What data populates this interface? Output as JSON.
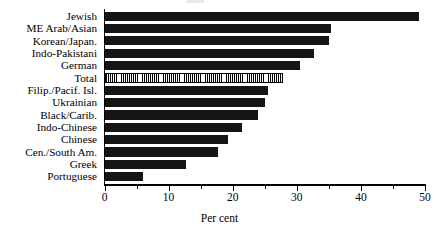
{
  "chart_data": {
    "type": "bar",
    "orientation": "horizontal",
    "title": "",
    "xlabel": "Per cent",
    "ylabel": "",
    "xlim": [
      0,
      50
    ],
    "xticks": [
      0,
      10,
      20,
      30,
      40,
      50
    ],
    "xtick_labels": [
      "0",
      "10",
      "20",
      "30",
      "40",
      "50"
    ],
    "minor_xticks": [
      5,
      15,
      25,
      35,
      45
    ],
    "grid": false,
    "legend": "none",
    "categories": [
      "Jewish",
      "ME Arab/Asian",
      "Korean/Japan.",
      "Indo-Pakistani",
      "German",
      "Total",
      "Filip./Pacif. Isl.",
      "Ukrainian",
      "Black/Carib.",
      "Indo-Chinese",
      "Chinese",
      "Cen./South Am.",
      "Greek",
      "Portuguese"
    ],
    "values": [
      49.0,
      35.3,
      35.0,
      32.7,
      30.5,
      27.8,
      25.5,
      25.0,
      24.0,
      21.4,
      19.3,
      17.7,
      12.7,
      6.0
    ],
    "highlighted_category": "Total",
    "highlight_style": "hatched",
    "bar_color": "#151515",
    "highlight_color": "#ffffff"
  }
}
